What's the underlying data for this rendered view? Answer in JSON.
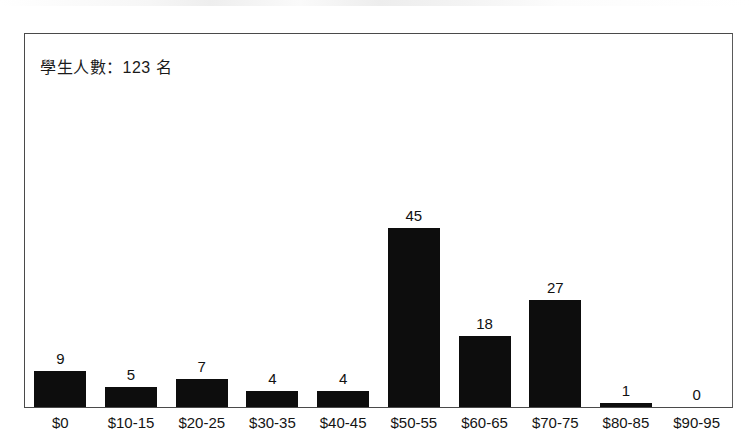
{
  "annotation": {
    "text": "學生人數：123 名"
  },
  "chart_data": {
    "type": "bar",
    "title": "",
    "subtitle": "",
    "xlabel": "",
    "ylabel": "",
    "categories": [
      "$0",
      "$10-15",
      "$20-25",
      "$30-35",
      "$40-45",
      "$50-55",
      "$60-65",
      "$70-75",
      "$80-85",
      "$90-95"
    ],
    "values": [
      9,
      5,
      7,
      4,
      4,
      45,
      18,
      27,
      1,
      0
    ],
    "value_labels": [
      "9",
      "5",
      "7",
      "4",
      "4",
      "45",
      "18",
      "27",
      "1",
      "0"
    ],
    "ylim": [
      0,
      94
    ],
    "grid": false,
    "legend": false,
    "bar_color": "#0d0d0d",
    "annotation": "學生人數：123 名"
  }
}
